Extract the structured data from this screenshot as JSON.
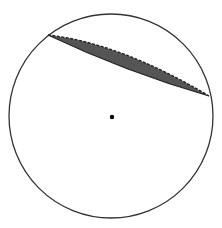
{
  "diagram": {
    "type": "circle-with-shaded-segment",
    "canvas": {
      "width": 222,
      "height": 228,
      "background": "#ffffff"
    },
    "circle": {
      "cx": 111,
      "cy": 116,
      "r": 102,
      "stroke": "#333333",
      "stroke_width": 1.3
    },
    "center_point": {
      "cx": 112,
      "cy": 117,
      "r": 2.2,
      "fill": "#000000"
    },
    "segment": {
      "start": {
        "x": 48,
        "y": 35
      },
      "end": {
        "x": 209,
        "y": 96
      },
      "upper_control": {
        "x": 120,
        "y": 43
      },
      "lower_control": {
        "x": 126,
        "y": 72
      },
      "fill": "#555555",
      "upper_edge_style": "dashed",
      "lower_edge_style": "solid",
      "edge_color": "#222222"
    }
  }
}
